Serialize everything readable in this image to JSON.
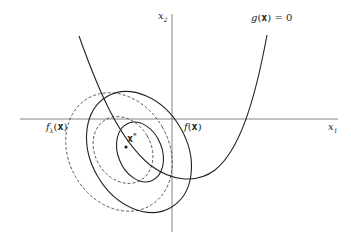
{
  "diagram": {
    "labels": {
      "x2_axis": {
        "var": "x",
        "sub": "2"
      },
      "x1_axis": {
        "var": "x",
        "sub": "1"
      },
      "constraint": {
        "func": "g",
        "open": "(",
        "arg": "x",
        "close": ")",
        "eq": " = 0"
      },
      "f_lambda": {
        "func": "f",
        "sub": "λ",
        "open": "(",
        "arg": "x",
        "close": ")"
      },
      "f": {
        "func": "f",
        "open": "(",
        "arg": "x",
        "close": ")"
      },
      "optimum": {
        "arg": "x",
        "sup": "*"
      }
    },
    "colors": {
      "stroke": "#222222",
      "axis": "#555555",
      "background": "#ffffff"
    }
  }
}
